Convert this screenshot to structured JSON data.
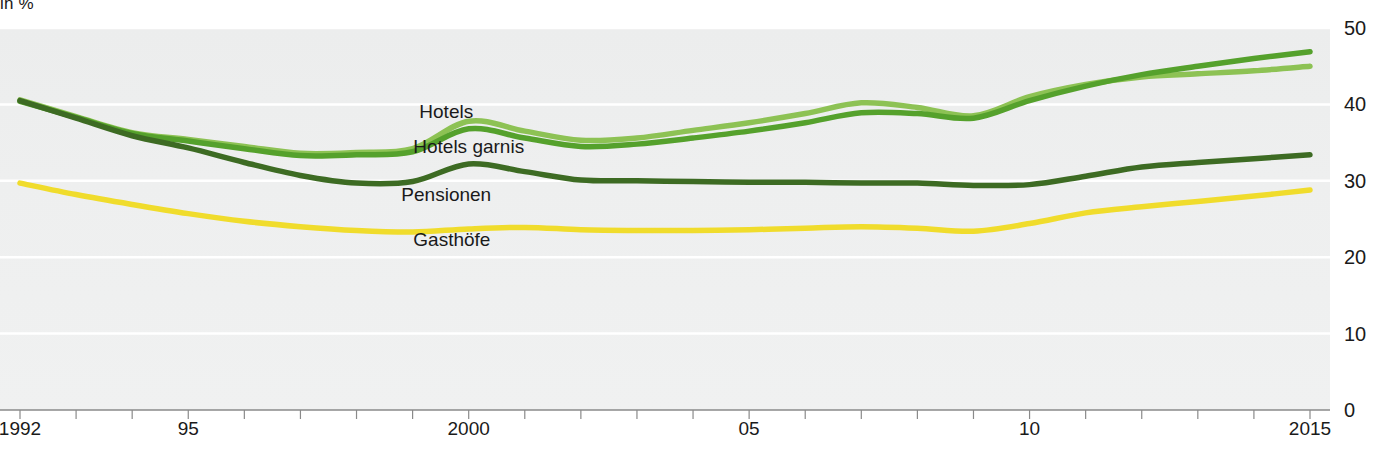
{
  "chart_data": {
    "type": "line",
    "title": "",
    "unit_label": "in %",
    "xlabel": "",
    "ylabel": "",
    "xlim": [
      1992,
      2015
    ],
    "ylim": [
      0,
      50
    ],
    "yticks": [
      0,
      10,
      20,
      30,
      40,
      50
    ],
    "ytick_labels": [
      "0",
      "10",
      "20",
      "30",
      "40",
      "50"
    ],
    "x": [
      1992,
      1993,
      1994,
      1995,
      1996,
      1997,
      1998,
      1999,
      2000,
      2001,
      2002,
      2003,
      2004,
      2005,
      2006,
      2007,
      2008,
      2009,
      2010,
      2011,
      2012,
      2013,
      2014,
      2015
    ],
    "xtick_labels_shown": [
      "1992",
      "95",
      "2000",
      "05",
      "10",
      "2015"
    ],
    "xtick_values_shown": [
      1992,
      1995,
      2000,
      2005,
      2010,
      2015
    ],
    "grid": true,
    "legend_position": "inline-right-of-lines",
    "series": [
      {
        "name": "Hotels",
        "color": "#8DC254",
        "values": [
          40.6,
          38.4,
          36.3,
          35.4,
          34.5,
          33.6,
          33.7,
          34.2,
          37.8,
          36.5,
          35.3,
          35.6,
          36.6,
          37.6,
          38.8,
          40.2,
          39.6,
          38.5,
          41.0,
          42.6,
          43.6,
          44.0,
          44.4,
          45.0
        ]
      },
      {
        "name": "Hotels garnis",
        "color": "#55A12C",
        "values": [
          40.4,
          38.3,
          36.2,
          35.2,
          34.2,
          33.3,
          33.4,
          33.8,
          36.8,
          35.6,
          34.5,
          34.8,
          35.6,
          36.5,
          37.6,
          38.9,
          38.8,
          38.2,
          40.5,
          42.4,
          43.9,
          45.0,
          46.0,
          46.9
        ]
      },
      {
        "name": "Pensionen",
        "color": "#3D6B23",
        "values": [
          40.5,
          38.2,
          35.9,
          34.3,
          32.4,
          30.7,
          29.7,
          29.9,
          32.2,
          31.2,
          30.1,
          30.0,
          29.9,
          29.8,
          29.8,
          29.7,
          29.7,
          29.4,
          29.5,
          30.6,
          31.8,
          32.4,
          32.9,
          33.4
        ]
      },
      {
        "name": "Gasthöfe",
        "color": "#F0DC2C",
        "values": [
          29.7,
          28.2,
          26.9,
          25.7,
          24.7,
          24.0,
          23.5,
          23.3,
          23.7,
          23.9,
          23.6,
          23.5,
          23.5,
          23.6,
          23.8,
          24.0,
          23.8,
          23.4,
          24.4,
          25.8,
          26.6,
          27.3,
          28.0,
          28.8
        ]
      }
    ],
    "series_label_positions": [
      {
        "name": "Hotels",
        "x": 1999.6,
        "y": 39.0
      },
      {
        "name": "Hotels garnis",
        "x": 2000.0,
        "y": 34.4
      },
      {
        "name": "Pensionen",
        "x": 1999.6,
        "y": 28.2
      },
      {
        "name": "Gasthöfe",
        "x": 1999.7,
        "y": 22.2
      }
    ]
  },
  "colors": {
    "plot_background": "#eeefef",
    "gridline": "#ffffff",
    "axis_line": "#8a8a8a",
    "text": "#1a1a1a"
  }
}
